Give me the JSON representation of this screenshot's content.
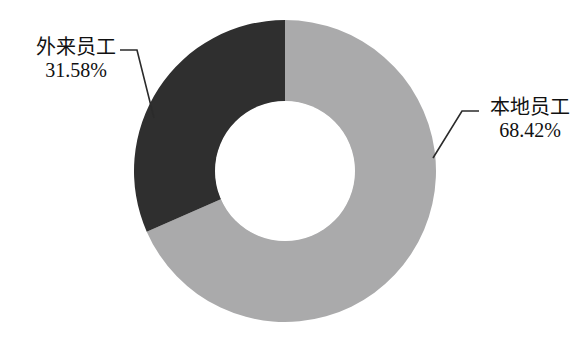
{
  "chart_data": {
    "type": "pie",
    "variant": "donut",
    "title": "",
    "subtitle": "",
    "xlabel": "",
    "ylabel": "",
    "legend_position": "none",
    "grid": false,
    "start_angle_deg": 0,
    "direction": "clockwise",
    "inner_radius_ratio": 0.46,
    "categories": [
      "本地员工",
      "外来员工"
    ],
    "values": [
      68.42,
      31.58
    ],
    "value_unit": "%",
    "labels": [
      "68.42%",
      "31.58%"
    ],
    "colors": [
      "#aaaaab",
      "#2f2f2f"
    ],
    "slices": [
      {
        "name": "本地员工",
        "value": 68.42,
        "value_label": "68.42%",
        "color": "#aaaaab",
        "angle_deg": 246.3
      },
      {
        "name": "外来员工",
        "value": 31.58,
        "value_label": "31.58%",
        "color": "#2f2f2f",
        "angle_deg": 113.7
      }
    ]
  },
  "labels": {
    "left": {
      "name": "外来员工",
      "value": "31.58%"
    },
    "right": {
      "name": "本地员工",
      "value": "68.42%"
    }
  },
  "style": {
    "background": "#ffffff",
    "leader_line_color": "#2b2b2b",
    "text_color": "#111111"
  }
}
